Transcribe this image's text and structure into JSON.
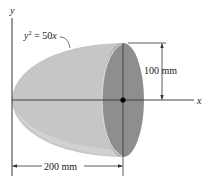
{
  "diagram": {
    "equation_lhs": "y",
    "equation_exp": "2",
    "equation_rhs": " = 50",
    "equation_var": "x",
    "axis_y_label": "y",
    "axis_x_label": "x",
    "dimension_radius": "100 mm",
    "dimension_length": "200 mm",
    "colors": {
      "body": "#c4c4c4",
      "end_face": "#8f8f8f",
      "line": "#333333"
    }
  }
}
